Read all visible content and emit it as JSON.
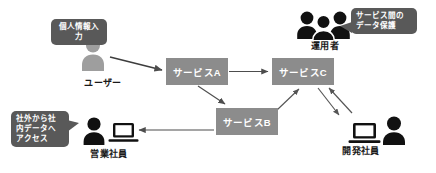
{
  "diagram": {
    "background_color": "#ffffff",
    "box_color": "#8c8c8c",
    "bubble_color": "#595959",
    "figure_color_light": "#9e9e9e",
    "figure_color_dark": "#1a1a1a",
    "arrow_color": "#4d4d4d"
  },
  "services": [
    {
      "id": "svc-a",
      "label": "サービスA"
    },
    {
      "id": "svc-c",
      "label": "サービスC"
    },
    {
      "id": "svc-b",
      "label": "サービスB"
    }
  ],
  "actors": [
    {
      "id": "user",
      "label": "ユーザー"
    },
    {
      "id": "admin",
      "label": "運用者"
    },
    {
      "id": "sales",
      "label": "営業社員"
    },
    {
      "id": "dev",
      "label": "開発社員"
    }
  ],
  "callouts": [
    {
      "id": "bubble-user",
      "text": "個人情報入力"
    },
    {
      "id": "bubble-admin",
      "text": "サービス間の\nデータ保護"
    },
    {
      "id": "bubble-sales",
      "text": "社外から社\n内データへ\nアクセス"
    }
  ],
  "connections": [
    {
      "from": "user",
      "to": "svc-a",
      "direction": "one-way"
    },
    {
      "from": "svc-a",
      "to": "svc-c",
      "direction": "one-way"
    },
    {
      "from": "svc-a",
      "to": "svc-b",
      "direction": "one-way"
    },
    {
      "from": "svc-b",
      "to": "svc-c",
      "direction": "one-way"
    },
    {
      "from": "svc-b",
      "to": "sales",
      "direction": "one-way"
    },
    {
      "from": "svc-c",
      "to": "dev",
      "direction": "two-way"
    }
  ]
}
